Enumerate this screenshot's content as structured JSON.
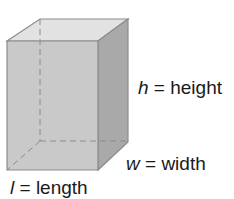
{
  "diagram": {
    "type": "rectangular-prism",
    "colors": {
      "front": "#c9c9c9",
      "top": "#e2e2e2",
      "side": "#a9a9a9",
      "edge": "#8c8c8c",
      "hidden": "#8a8a8a"
    },
    "labels": {
      "height": {
        "var": "h",
        "eq": " = ",
        "word": "height"
      },
      "width": {
        "var": "w",
        "eq": " = ",
        "word": "width"
      },
      "length": {
        "var": "l",
        "eq": " = ",
        "word": "length"
      }
    }
  }
}
